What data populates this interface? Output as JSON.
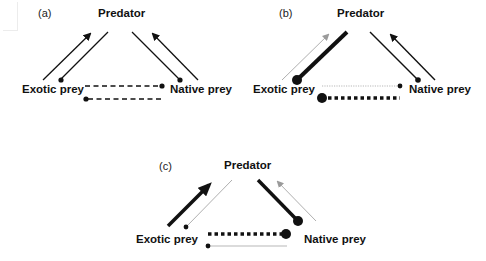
{
  "figure": {
    "colors": {
      "strong": "#111111",
      "weak": "#9a9a9a",
      "background": "#ffffff"
    },
    "panels": [
      {
        "id": "a",
        "label": "(a)",
        "nodes": {
          "predator": "Predator",
          "exotic": "Exotic prey",
          "native": "Native prey"
        },
        "description": "Symmetric: all interactions equal strength; dashed mutual competition"
      },
      {
        "id": "b",
        "label": "(b)",
        "nodes": {
          "predator": "Predator",
          "exotic": "Exotic prey",
          "native": "Native prey"
        },
        "description": "Strong predator effect on exotic prey; exotic prey strongly affects native prey"
      },
      {
        "id": "c",
        "label": "(c)",
        "nodes": {
          "predator": "Predator",
          "exotic": "Exotic prey",
          "native": "Native prey"
        },
        "description": "Exotic prey strongly benefits predator; predator strongly suppresses native prey; strong apparent competition on native prey"
      }
    ]
  }
}
